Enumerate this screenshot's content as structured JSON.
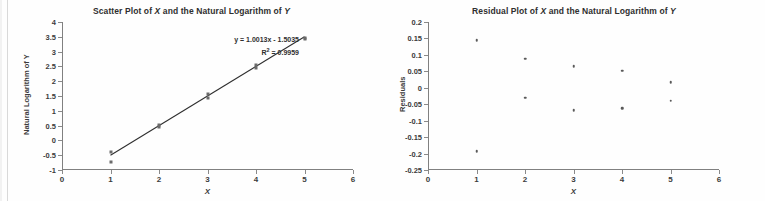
{
  "figure": {
    "background": "#fefefe",
    "marker_color": "#5a5a5a",
    "axis_color": "#808080",
    "text_color": "#3b3b3b"
  },
  "charts": [
    {
      "id": "scatter",
      "title_prefix": "Scatter Plot of ",
      "title_var1": "X",
      "title_mid": " and the Natural Logarithm of ",
      "title_var2": "Y",
      "full_title": "Scatter Plot of X and the Natural Logarithm of Y",
      "xlabel": "X",
      "ylabel": "Natural Logarithm of Y",
      "equation": "y = 1.0013x - 1.5035",
      "r_squared_prefix": "R",
      "r_squared_sup": "2",
      "r_squared_value": " = 0.9959",
      "r_squared_full": "R² = 0.9959",
      "xticks": [
        "0",
        "1",
        "2",
        "3",
        "4",
        "5",
        "6"
      ],
      "yticks": [
        "4",
        "3.5",
        "3",
        "2.5",
        "2",
        "1.5",
        "1",
        "0.5",
        "0",
        "-0.5",
        "-1"
      ]
    },
    {
      "id": "residual",
      "title_prefix": "Residual Plot of ",
      "title_var1": "X",
      "title_mid": " and the Natural Logarithm of ",
      "title_var2": "Y",
      "full_title": "Residual Plot of X and the Natural Logarithm of Y",
      "xlabel": "X",
      "ylabel": "Residuals",
      "xticks": [
        "0",
        "1",
        "2",
        "3",
        "4",
        "5",
        "6"
      ],
      "yticks": [
        "0.2",
        "0.15",
        "0.1",
        "0.05",
        "0",
        "-0.05",
        "-0.1",
        "-0.15",
        "-0.2",
        "-0.25"
      ]
    }
  ],
  "chart_data": [
    {
      "type": "scatter",
      "title": "Scatter Plot of X and the Natural Logarithm of Y",
      "xlabel": "X",
      "ylabel": "Natural Logarithm of Y",
      "xlim": [
        0,
        6
      ],
      "ylim": [
        -1,
        4
      ],
      "xticks": [
        0,
        1,
        2,
        3,
        4,
        5,
        6
      ],
      "yticks": [
        -1,
        -0.5,
        0,
        0.5,
        1,
        1.5,
        2,
        2.5,
        3,
        3.5,
        4
      ],
      "grid": false,
      "legend": "none",
      "x": [
        1,
        1,
        2,
        2,
        3,
        3,
        4,
        4,
        5,
        5
      ],
      "y": [
        -0.4,
        -0.72,
        0.52,
        0.46,
        1.56,
        1.43,
        2.55,
        2.44,
        3.47,
        3.42
      ],
      "trendline": {
        "equation": "y = 1.0013x - 1.5035",
        "slope": 1.0013,
        "intercept": -1.5035,
        "r_squared": 0.9959,
        "x_start": 1,
        "x_end": 5
      },
      "annotations": [
        "y = 1.0013x - 1.5035",
        "R² = 0.9959"
      ]
    },
    {
      "type": "scatter",
      "title": "Residual Plot of X and the Natural Logarithm of Y",
      "xlabel": "X",
      "ylabel": "Residuals",
      "xlim": [
        0,
        6
      ],
      "ylim": [
        -0.25,
        0.2
      ],
      "xticks": [
        0,
        1,
        2,
        3,
        4,
        5,
        6
      ],
      "yticks": [
        -0.25,
        -0.2,
        -0.15,
        -0.1,
        -0.05,
        0,
        0.05,
        0.1,
        0.15,
        0.2
      ],
      "grid": false,
      "legend": "none",
      "x": [
        1,
        1,
        2,
        2,
        3,
        3,
        4,
        4,
        5,
        5
      ],
      "y": [
        0.145,
        -0.193,
        0.088,
        -0.031,
        0.065,
        -0.069,
        0.052,
        -0.063,
        0.017,
        -0.039
      ]
    }
  ]
}
